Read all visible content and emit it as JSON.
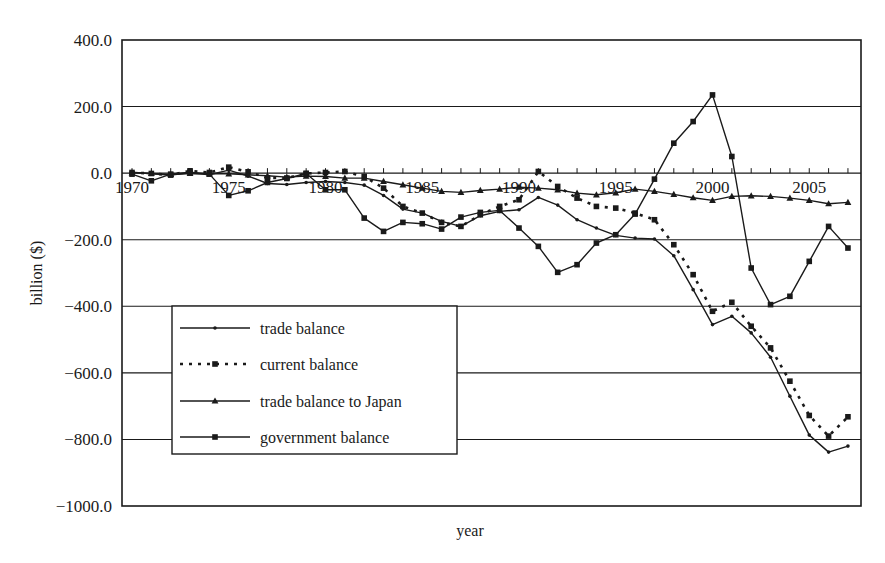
{
  "chart_data": {
    "type": "line",
    "title": "",
    "xlabel": "year",
    "ylabel": "billion ($)",
    "ylim": [
      -1000,
      400
    ],
    "xlim": [
      1970,
      2007
    ],
    "grid": true,
    "y_ticks": [
      "400.0",
      "200.0",
      "0.0",
      "-200.0",
      "-400.0",
      "-600.0",
      "-800.0",
      "-1000.0"
    ],
    "y_tick_values": [
      400,
      200,
      0,
      -200,
      -400,
      -600,
      -800,
      -1000
    ],
    "x_tick_labels": [
      "1970",
      "1975",
      "1980",
      "1985",
      "1990",
      "1995",
      "2000",
      "2005"
    ],
    "x_tick_values": [
      1970,
      1975,
      1980,
      1985,
      1990,
      1995,
      2000,
      2005
    ],
    "legend_position": "lower-left inside plot",
    "x": [
      1970,
      1971,
      1972,
      1973,
      1974,
      1975,
      1976,
      1977,
      1978,
      1979,
      1980,
      1981,
      1982,
      1983,
      1984,
      1985,
      1986,
      1987,
      1988,
      1989,
      1990,
      1991,
      1992,
      1993,
      1994,
      1995,
      1996,
      1997,
      1998,
      1999,
      2000,
      2001,
      2002,
      2003,
      2004,
      2005,
      2006,
      2007
    ],
    "series": [
      {
        "name": "trade balance",
        "style": "solid",
        "marker": "dot",
        "values": [
          3,
          -2,
          -6,
          1,
          -5,
          9,
          -9,
          -31,
          -34,
          -28,
          -25,
          -28,
          -36,
          -67,
          -108,
          -120,
          -145,
          -160,
          -128,
          -115,
          -110,
          -73,
          -96,
          -140,
          -165,
          -187,
          -195,
          -198,
          -248,
          -350,
          -455,
          -430,
          -480,
          -553,
          -670,
          -787,
          -838,
          -820
        ]
      },
      {
        "name": "current balance",
        "style": "dotted",
        "marker": "square",
        "values": [
          2,
          -1,
          -6,
          7,
          2,
          18,
          4,
          -14,
          -15,
          -1,
          2,
          5,
          -10,
          -45,
          -100,
          -120,
          -148,
          -160,
          -125,
          -100,
          -80,
          5,
          -40,
          -75,
          -100,
          -105,
          -120,
          -140,
          -215,
          -305,
          -415,
          -388,
          -460,
          -525,
          -625,
          -728,
          -790,
          -732
        ]
      },
      {
        "name": "trade balance to Japan",
        "style": "solid",
        "marker": "triangle",
        "values": [
          1,
          -1,
          -4,
          -1,
          -2,
          -2,
          -5,
          -8,
          -12,
          -9,
          -10,
          -15,
          -15,
          -25,
          -35,
          -45,
          -55,
          -58,
          -52,
          -48,
          -42,
          -45,
          -50,
          -60,
          -65,
          -59,
          -48,
          -55,
          -64,
          -74,
          -82,
          -70,
          -68,
          -70,
          -75,
          -82,
          -92,
          -88
        ]
      },
      {
        "name": "government balance",
        "style": "solid",
        "marker": "square",
        "values": [
          -3,
          -23,
          -3,
          3,
          -3,
          -67,
          -53,
          -28,
          -16,
          -1,
          -50,
          -50,
          -135,
          -175,
          -148,
          -152,
          -168,
          -132,
          -118,
          -112,
          -165,
          -220,
          -298,
          -275,
          -210,
          -185,
          -123,
          -18,
          90,
          155,
          235,
          50,
          -285,
          -395,
          -370,
          -265,
          -160,
          -225
        ]
      }
    ]
  }
}
